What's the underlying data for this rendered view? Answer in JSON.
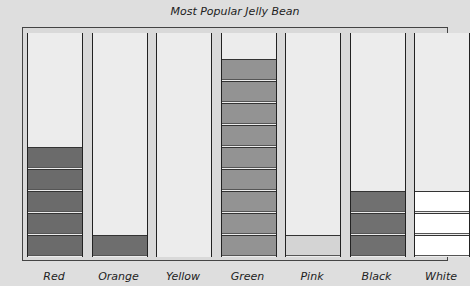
{
  "chart_data": {
    "type": "bar",
    "title": "Most Popular Jelly Bean",
    "categories": [
      "Red",
      "Orange",
      "Yellow",
      "Green",
      "Pink",
      "Black",
      "White"
    ],
    "values": [
      5,
      1,
      0,
      9,
      1,
      3,
      3
    ],
    "xlabel": "",
    "ylabel": "",
    "grid": false,
    "style": "stacked blocks (pictograph)",
    "colors": [
      "#6b6b6b",
      "#6e6e6e",
      "#e0e0e0",
      "#939393",
      "#d4d4d4",
      "#707070",
      "#ffffff"
    ]
  },
  "title": "Most Popular Jelly Bean",
  "labels": [
    "Red",
    "Orange",
    "Yellow",
    "Green",
    "Pink",
    "Black",
    "White"
  ]
}
